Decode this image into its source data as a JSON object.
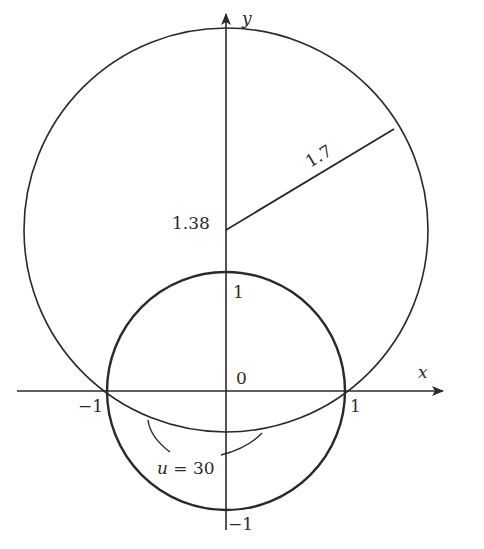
{
  "diagram": {
    "axes": {
      "x_label": "x",
      "y_label": "y",
      "origin_label": "0",
      "x_ticks": [
        {
          "value": -1,
          "label": "−1"
        },
        {
          "value": 1,
          "label": "1"
        }
      ],
      "y_ticks": [
        {
          "value": 1,
          "label": "1"
        },
        {
          "value": -1,
          "label": "−1"
        },
        {
          "value": 1.38,
          "label": "1.38"
        }
      ]
    },
    "unit_circle": {
      "center": [
        0,
        0
      ],
      "radius": 1
    },
    "big_circle": {
      "center": [
        0,
        1.38
      ],
      "radius": 1.7,
      "radius_label": "1.7"
    },
    "annotation": {
      "text": "u = 30",
      "u_var": "u",
      "eq": " = 30"
    },
    "colors": {
      "stroke": "#2a2a2a",
      "background": "#ffffff"
    }
  }
}
